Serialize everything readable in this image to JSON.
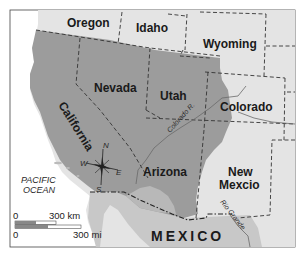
{
  "map": {
    "type": "historical-region-map",
    "colors": {
      "background": "#ffffff",
      "land": "#e4e4e4",
      "mexico": "#c8c8c8",
      "highlighted_region": "#9c9c9c",
      "border": "#333333",
      "river": "#6a6a6a"
    },
    "states": [
      {
        "name": "Oregon"
      },
      {
        "name": "Idaho"
      },
      {
        "name": "Wyoming"
      },
      {
        "name": "Nevada"
      },
      {
        "name": "Utah"
      },
      {
        "name": "Colorado"
      },
      {
        "name": "California"
      },
      {
        "name": "Arizona"
      },
      {
        "name": "New Mexcio"
      }
    ],
    "country_label": "MEXICO",
    "ocean_label": [
      "PACIFIC",
      "OCEAN"
    ],
    "rivers": [
      {
        "name": "Colorado R."
      },
      {
        "name": "Rio Grande"
      }
    ],
    "compass": {
      "n": "N",
      "s": "S",
      "e": "E",
      "w": "W"
    },
    "scale_bar": {
      "km": {
        "start": "0",
        "end": "300 km"
      },
      "mi": {
        "start": "0",
        "end": "300 mi"
      }
    }
  }
}
